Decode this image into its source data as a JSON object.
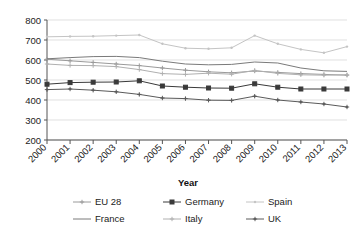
{
  "chart_data": {
    "type": "line",
    "title": "",
    "xlabel": "Year",
    "ylabel": "",
    "grid": true,
    "legend_position": "bottom",
    "x": [
      2000,
      2001,
      2002,
      2003,
      2004,
      2005,
      2006,
      2007,
      2008,
      2009,
      2010,
      2011,
      2012,
      2013
    ],
    "categories": [
      "2000",
      "2001",
      "2002",
      "2003",
      "2004",
      "2005",
      "2006",
      "2007",
      "2008",
      "2009",
      "2010",
      "2011",
      "2012",
      "2013"
    ],
    "ylim": [
      200,
      800
    ],
    "yticks": [
      200,
      300,
      400,
      500,
      600,
      700,
      800
    ],
    "xlim": [
      2000,
      2013
    ],
    "series": [
      {
        "name": "EU 28",
        "color": "#9a9a9a",
        "marker": "cross",
        "values": [
          604,
          596,
          588,
          580,
          572,
          560,
          549,
          541,
          536,
          545,
          538,
          532,
          528,
          524
        ]
      },
      {
        "name": "Germany",
        "color": "#3a3a3a",
        "marker": "square",
        "values": [
          479,
          487,
          489,
          490,
          496,
          470,
          464,
          460,
          459,
          481,
          464,
          455,
          455,
          455
        ]
      },
      {
        "name": "Spain",
        "color": "#c4c4c4",
        "marker": "dot",
        "values": [
          716,
          718,
          719,
          722,
          725,
          681,
          659,
          656,
          661,
          722,
          681,
          653,
          636,
          667
        ]
      },
      {
        "name": "France",
        "color": "#7a7a7a",
        "marker": "none",
        "values": [
          606,
          612,
          617,
          618,
          612,
          594,
          580,
          576,
          578,
          590,
          585,
          560,
          546,
          543
        ]
      },
      {
        "name": "Italy",
        "color": "#b0b0b0",
        "marker": "plus",
        "values": [
          580,
          573,
          572,
          567,
          552,
          532,
          528,
          534,
          529,
          548,
          533,
          526,
          524,
          526
        ]
      },
      {
        "name": "UK",
        "color": "#5a5a5a",
        "marker": "plus-dk",
        "values": [
          452,
          455,
          449,
          441,
          428,
          410,
          407,
          399,
          398,
          419,
          400,
          390,
          380,
          365
        ]
      }
    ]
  },
  "legend": {
    "items": [
      {
        "label": "EU 28"
      },
      {
        "label": "Germany"
      },
      {
        "label": "Spain"
      },
      {
        "label": "France"
      },
      {
        "label": "Italy"
      },
      {
        "label": "UK"
      }
    ]
  },
  "axis": {
    "x_title": "Year",
    "y_labels": [
      "800",
      "700",
      "600",
      "500",
      "400",
      "300",
      "200"
    ],
    "x_labels": [
      "2000",
      "2001",
      "2002",
      "2003",
      "2004",
      "2005",
      "2006",
      "2007",
      "2008",
      "2009",
      "2010",
      "2011",
      "2012",
      "2013"
    ]
  }
}
